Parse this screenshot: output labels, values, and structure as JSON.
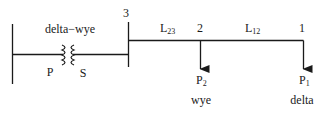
{
  "diagram": {
    "title": "",
    "transformer": {
      "label": "delta−wye",
      "primary_label": "P",
      "secondary_label": "S"
    },
    "buses": [
      {
        "id": "3",
        "label": "3"
      },
      {
        "id": "2",
        "label": "2"
      },
      {
        "id": "1",
        "label": "1"
      }
    ],
    "lines": [
      {
        "id": "L23",
        "label_main": "L",
        "label_sub": "23"
      },
      {
        "id": "L12",
        "label_main": "L",
        "label_sub": "12"
      }
    ],
    "loads": [
      {
        "id": "P2",
        "label_main": "P",
        "label_sub": "2",
        "connection": "wye"
      },
      {
        "id": "P1",
        "label_main": "P",
        "label_sub": "1",
        "connection": "delta"
      }
    ],
    "colors": {
      "line": "#1a1a1a",
      "background": "#ffffff"
    }
  }
}
